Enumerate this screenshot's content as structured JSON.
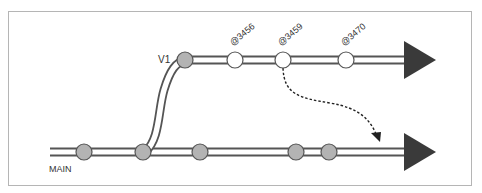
{
  "diagram": {
    "colors": {
      "line": "#555555",
      "node_gray": "#b3b3b3",
      "node_white": "#ffffff",
      "arrow": "#3a3a3a",
      "frame": "#b5b5b5"
    },
    "branches": [
      {
        "name": "MAIN",
        "label": "MAIN",
        "commits": [
          {
            "type": "gray"
          },
          {
            "type": "gray",
            "note": "branch point"
          },
          {
            "type": "gray"
          },
          {
            "type": "gray"
          },
          {
            "type": "gray"
          }
        ]
      },
      {
        "name": "V1",
        "label": "V1",
        "commits": [
          {
            "type": "gray",
            "label": ""
          },
          {
            "type": "white",
            "label": "@3456"
          },
          {
            "type": "white",
            "label": "@3459"
          },
          {
            "type": "white",
            "label": "@3470"
          }
        ]
      }
    ],
    "labels": {
      "main": "MAIN",
      "v1": "V1",
      "c1": "@3456",
      "c2": "@3459",
      "c3": "@3470"
    },
    "merge_arrow": {
      "from": "@3459",
      "to": "MAIN",
      "style": "dashed"
    }
  }
}
